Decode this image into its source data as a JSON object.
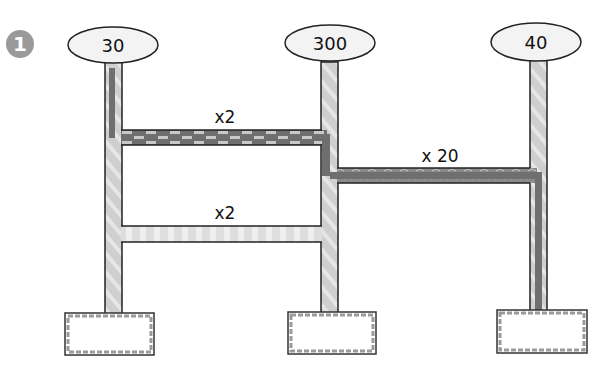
{
  "step_badge": {
    "number": "1",
    "color": "#9a9a9a"
  },
  "sources": [
    {
      "id": "left",
      "label": "30"
    },
    {
      "id": "middle",
      "label": "300"
    },
    {
      "id": "right",
      "label": "40"
    }
  ],
  "edges": [
    {
      "id": "top-connector",
      "label": "x2",
      "style": "dark-dashed"
    },
    {
      "id": "right-connector",
      "label": "x 20",
      "style": "dark"
    },
    {
      "id": "lower-connector",
      "label": "x2",
      "style": "light-striped"
    }
  ],
  "targets": [
    {
      "id": "left-box",
      "label": ""
    },
    {
      "id": "middle-box",
      "label": ""
    },
    {
      "id": "right-box",
      "label": ""
    }
  ],
  "colors": {
    "pipe_light": "#cfcfcf",
    "pipe_stripe": "#e8e8e8",
    "pipe_dark": "#7a7a7a",
    "outline": "#222222",
    "ellipse_fill": "#f3f3f3",
    "box_border": "#8a8a8a"
  }
}
